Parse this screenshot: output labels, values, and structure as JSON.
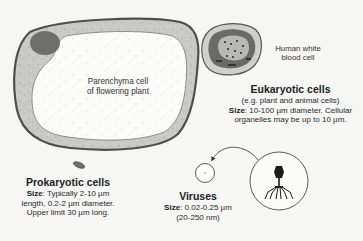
{
  "diagram": {
    "plant_cell": {
      "label_line1": "Parenchyma cell",
      "label_line2": "of flowering plant"
    },
    "white_blood_cell": {
      "label_line1": "Human white",
      "label_line2": "blood cell"
    },
    "eukaryotic": {
      "title": "Eukaryotic cells",
      "subtitle": "(e.g. plant and animal cells)",
      "size_label": "Size",
      "size_line1": ": 10-100 µm diameter. Cellular",
      "size_line2": "organelles may be up to 10 µm."
    },
    "prokaryotic": {
      "title": "Prokaryotic cells",
      "size_label": "Size",
      "size_line1": ": Typically 2-10 µm",
      "size_line2": "length, 0.2-2 µm diameter.",
      "size_line3": "Upper limit 30 µm long."
    },
    "viruses": {
      "title": "Viruses",
      "size_label": "Size",
      "size_line1": ": 0.02-0.25 µm",
      "size_line2": "(20-250 nm)"
    },
    "icons": {
      "plant_cell": "plant-cell-illustration",
      "white_blood_cell": "white-blood-cell-illustration",
      "bacterium": "bacterium-illustration",
      "virus_small": "virus-scale-circle",
      "bacteriophage": "bacteriophage-illustration",
      "arrow": "curved-arrow"
    },
    "colors": {
      "background": "#f6f6f4",
      "cell_wall": "#5a5a5a",
      "cytoplasm": "#c9c9c5",
      "vacuole": "#fbfbf8",
      "nucleus": "#6e6e6c",
      "text": "#2a2a2a"
    }
  }
}
